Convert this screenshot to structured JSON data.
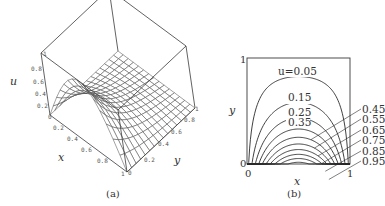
{
  "chart_data": [
    {
      "panel": "a",
      "type": "surface3d",
      "caption": "(a)",
      "xlabel": "x",
      "ylabel": "y",
      "zlabel": "u",
      "x_ticks": [
        "0",
        "0.2",
        "0.4",
        "0.6",
        "0.8",
        "1"
      ],
      "y_ticks": [
        "0",
        "0.2",
        "0.4",
        "0.6",
        "0.8",
        "1"
      ],
      "z_ticks": [
        "0",
        "0.2",
        "0.4",
        "0.6",
        "0.8",
        "1"
      ],
      "xlim": [
        0,
        1
      ],
      "ylim": [
        0,
        1
      ],
      "zlim": [
        0,
        1
      ],
      "function": "u = sin(pi x) * sinh(pi (1 - y)) / sinh(pi)",
      "mesh": 15
    },
    {
      "panel": "b",
      "type": "contour",
      "caption": "(b)",
      "xlabel": "x",
      "ylabel": "y",
      "x_ticks": [
        "0",
        "1"
      ],
      "y_ticks": [
        "0",
        "1"
      ],
      "xlim": [
        0,
        1
      ],
      "ylim": [
        0,
        1
      ],
      "first_label_prefix": "u=",
      "levels": [
        0.05,
        0.15,
        0.25,
        0.35,
        0.45,
        0.55,
        0.65,
        0.75,
        0.85,
        0.95
      ],
      "level_labels": [
        "0.05",
        "0.15",
        "0.25",
        "0.35",
        "0.45",
        "0.55",
        "0.65",
        "0.75",
        "0.85",
        "0.95"
      ],
      "inline_labeled_levels": [
        "0.05",
        "0.15",
        "0.25",
        "0.35"
      ],
      "side_labeled_levels": [
        "0.45",
        "0.55",
        "0.65",
        "0.75",
        "0.85",
        "0.95"
      ]
    }
  ],
  "labels": {
    "a": {
      "caption": "(a)",
      "x": "x",
      "y": "y",
      "u": "u",
      "xt": [
        "0",
        "0.2",
        "0.4",
        "0.6",
        "0.8",
        "1"
      ],
      "yt": [
        "0",
        "0.2",
        "0.4",
        "0.6",
        "0.8",
        "1"
      ],
      "zt": [
        "0",
        "0.2",
        "0.4",
        "0.6",
        "0.8",
        "1"
      ]
    },
    "b": {
      "caption": "(b)",
      "x": "x",
      "y": "y",
      "x0": "0",
      "x1": "1",
      "y0": "0",
      "y1": "1",
      "u005": "u=0.05",
      "l015": "0.15",
      "l025": "0.25",
      "l035": "0.35",
      "side": [
        "0.45",
        "0.55",
        "0.65",
        "0.75",
        "0.85",
        "0.95"
      ]
    }
  },
  "style": {
    "line_color": "#2a2a2a",
    "box_color": "#3a3a3a",
    "mesh_color": "#444444"
  }
}
